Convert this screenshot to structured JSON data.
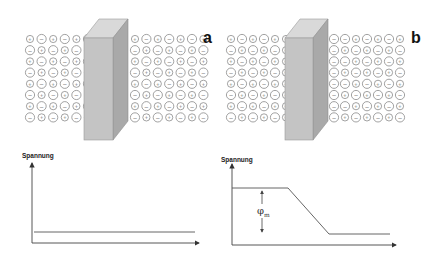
{
  "panels": [
    {
      "id": "a",
      "label": "a",
      "membrane": {
        "front": [
          84,
          38,
          29,
          102
        ],
        "depth": [
          15,
          -19
        ]
      },
      "ions_left": {
        "x0": 30,
        "y0": 39,
        "cols": 6,
        "rows": 8,
        "dx": 11.6,
        "dy": 11.2,
        "pattern": "alternating"
      },
      "ions_right": {
        "x0": 135,
        "y0": 39,
        "cols": 7,
        "rows": 8,
        "dx": 11.4,
        "dy": 11.2,
        "pattern": "alternating"
      },
      "graph": {
        "ylabel": "Spannung",
        "curve": "flat",
        "description": "Constant potential across membrane (no potential difference)"
      }
    },
    {
      "id": "b",
      "label": "b",
      "membrane": {
        "front": [
          285,
          38,
          28,
          102
        ],
        "depth": [
          15,
          -19
        ]
      },
      "ions_left": {
        "x0": 231,
        "y0": 39,
        "cols": 6,
        "rows": 8,
        "dx": 11.0,
        "dy": 11.2,
        "pattern": "alternating_last_col_cation"
      },
      "ions_right": {
        "x0": 334,
        "y0": 39,
        "cols": 7,
        "rows": 8,
        "dx": 11.0,
        "dy": 11.2,
        "pattern": "alternating_first_col_anion"
      },
      "graph": {
        "ylabel": "Spannung",
        "curve": "step-down",
        "annotation": {
          "symbol": "φ",
          "subscript": "m"
        },
        "description": "Potential drops across membrane; membrane potential φm"
      }
    }
  ],
  "legend": {
    "cation_symbol": "+",
    "anion_symbol": "−"
  },
  "chart_data": [
    {
      "type": "line",
      "title": "a",
      "ylabel": "Spannung",
      "xlabel": "",
      "x": [
        0,
        1
      ],
      "series": [
        {
          "name": "Spannung",
          "values": [
            1,
            1
          ]
        }
      ],
      "ylim": [
        0,
        8
      ]
    },
    {
      "type": "line",
      "title": "b",
      "ylabel": "Spannung",
      "xlabel": "",
      "x": [
        0,
        0.35,
        0.6,
        1
      ],
      "series": [
        {
          "name": "Spannung",
          "values": [
            5.6,
            5.6,
            1,
            1
          ]
        }
      ],
      "annotations": [
        "φm"
      ],
      "ylim": [
        0,
        8
      ]
    }
  ],
  "colors": {
    "membrane_front": "#c4c4c4",
    "membrane_top": "#d9d9d9",
    "membrane_side": "#a9a9a9",
    "line": "#555555"
  }
}
